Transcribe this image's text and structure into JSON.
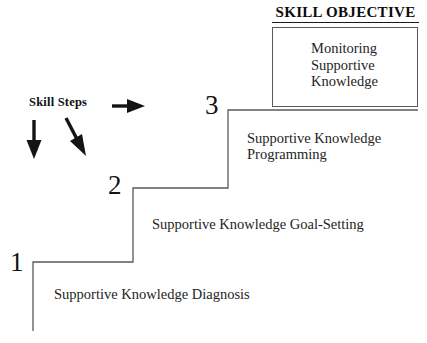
{
  "diagram": {
    "legend_label": "Skill Steps",
    "objective_heading": "SKILL OBJECTIVE",
    "objective_body": "Monitoring\nSupportive\nKnowledge",
    "line_color": "#555555",
    "text_color": "#242424",
    "background": "#ffffff",
    "steps": [
      {
        "number": "1",
        "caption": "Supportive Knowledge Diagnosis"
      },
      {
        "number": "2",
        "caption": "Supportive Knowledge Goal-Setting"
      },
      {
        "number": "3",
        "caption": "Supportive Knowledge\nProgramming"
      }
    ],
    "arrows": [
      {
        "name": "down-arrow-left",
        "direction": "down"
      },
      {
        "name": "down-arrow-diagonal",
        "direction": "down-right"
      },
      {
        "name": "right-arrow",
        "direction": "right"
      }
    ]
  }
}
